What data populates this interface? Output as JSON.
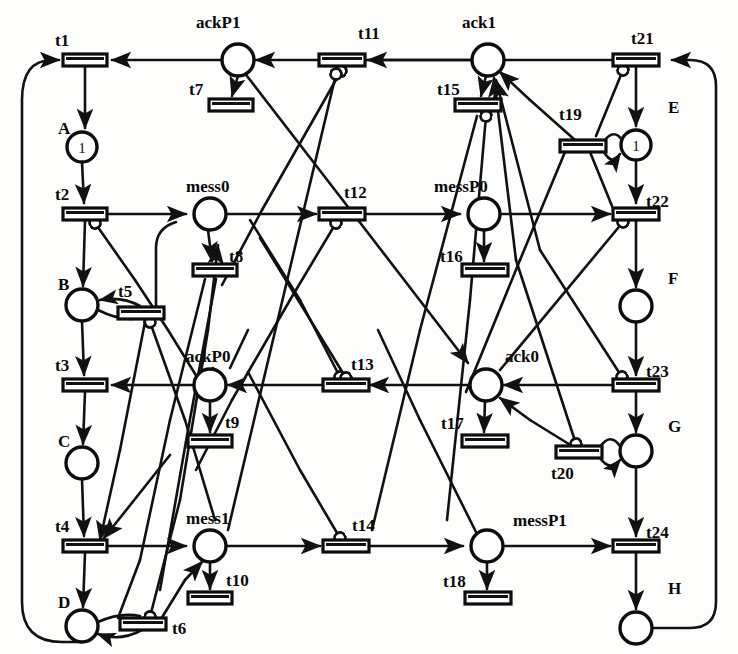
{
  "figure": {
    "kind": "petri-net",
    "title": "",
    "background_color": "#fdfdfb",
    "stroke_color": "#111111"
  },
  "places": [
    {
      "id": "A",
      "label": "A",
      "label_pos": "left",
      "x": 82,
      "y": 147,
      "r": 15,
      "tokens": 1,
      "token_text": "1"
    },
    {
      "id": "B",
      "label": "B",
      "label_pos": "left",
      "x": 82,
      "y": 305,
      "r": 16,
      "tokens": 0,
      "token_text": ""
    },
    {
      "id": "C",
      "label": "C",
      "label_pos": "left",
      "x": 82,
      "y": 463,
      "r": 16,
      "tokens": 0,
      "token_text": ""
    },
    {
      "id": "D",
      "label": "D",
      "label_pos": "left",
      "x": 82,
      "y": 626,
      "r": 16,
      "tokens": 0,
      "token_text": ""
    },
    {
      "id": "E",
      "label": "E",
      "label_pos": "right",
      "x": 636,
      "y": 145,
      "r": 15,
      "tokens": 1,
      "token_text": "1"
    },
    {
      "id": "F",
      "label": "F",
      "label_pos": "right",
      "x": 636,
      "y": 306,
      "r": 16,
      "tokens": 0,
      "token_text": ""
    },
    {
      "id": "G",
      "label": "G",
      "label_pos": "right",
      "x": 636,
      "y": 451,
      "r": 16,
      "tokens": 0,
      "token_text": ""
    },
    {
      "id": "H",
      "label": "H",
      "label_pos": "right",
      "x": 636,
      "y": 628,
      "r": 16,
      "tokens": 0,
      "token_text": ""
    },
    {
      "id": "ackP1",
      "label": "ackP1",
      "label_pos": "above",
      "x": 238,
      "y": 60,
      "r": 16,
      "tokens": 0,
      "token_text": ""
    },
    {
      "id": "mess0",
      "label": "mess0",
      "label_pos": "above",
      "x": 210,
      "y": 214,
      "r": 16,
      "tokens": 0,
      "token_text": ""
    },
    {
      "id": "ackP0",
      "label": "ackP0",
      "label_pos": "above",
      "x": 210,
      "y": 385,
      "r": 16,
      "tokens": 0,
      "token_text": ""
    },
    {
      "id": "mess1",
      "label": "mess1",
      "label_pos": "above",
      "x": 210,
      "y": 546,
      "r": 16,
      "tokens": 0,
      "token_text": ""
    },
    {
      "id": "ack1",
      "label": "ack1",
      "label_pos": "above",
      "x": 488,
      "y": 60,
      "r": 16,
      "tokens": 0,
      "token_text": ""
    },
    {
      "id": "messP0",
      "label": "messP0",
      "label_pos": "above",
      "x": 484,
      "y": 214,
      "r": 16,
      "tokens": 0,
      "token_text": ""
    },
    {
      "id": "ack0",
      "label": "ack0",
      "label_pos": "above",
      "x": 486,
      "y": 385,
      "r": 16,
      "tokens": 0,
      "token_text": ""
    },
    {
      "id": "messP1",
      "label": "messP1",
      "label_pos": "right",
      "x": 487,
      "y": 546,
      "r": 16,
      "tokens": 0,
      "token_text": ""
    }
  ],
  "transitions": [
    {
      "id": "t1",
      "label": "t1",
      "label_pos": "above-left",
      "x": 85,
      "y": 60,
      "w": 44,
      "h": 11,
      "orient": "h"
    },
    {
      "id": "t2",
      "label": "t2",
      "label_pos": "above-left",
      "x": 85,
      "y": 214,
      "w": 44,
      "h": 11,
      "orient": "h"
    },
    {
      "id": "t3",
      "label": "t3",
      "label_pos": "above-left",
      "x": 85,
      "y": 385,
      "w": 44,
      "h": 11,
      "orient": "h"
    },
    {
      "id": "t4",
      "label": "t4",
      "label_pos": "above-left",
      "x": 85,
      "y": 546,
      "w": 44,
      "h": 11,
      "orient": "h"
    },
    {
      "id": "t5",
      "label": "t5",
      "label_pos": "above-left",
      "x": 140,
      "y": 313,
      "w": 44,
      "h": 11,
      "orient": "h"
    },
    {
      "id": "t6",
      "label": "t6",
      "label_pos": "right",
      "x": 142,
      "y": 624,
      "w": 44,
      "h": 11,
      "orient": "h"
    },
    {
      "id": "t7",
      "label": "t7",
      "label_pos": "left",
      "x": 225,
      "y": 105,
      "w": 44,
      "h": 11,
      "orient": "h"
    },
    {
      "id": "t8",
      "label": "t8",
      "label_pos": "right",
      "x": 213,
      "y": 270,
      "w": 44,
      "h": 11,
      "orient": "h"
    },
    {
      "id": "t9",
      "label": "t9",
      "label_pos": "right",
      "x": 210,
      "y": 441,
      "w": 44,
      "h": 11,
      "orient": "h"
    },
    {
      "id": "t10",
      "label": "t10",
      "label_pos": "right",
      "x": 210,
      "y": 598,
      "w": 44,
      "h": 11,
      "orient": "h"
    },
    {
      "id": "t11",
      "label": "t11",
      "label_pos": "above",
      "x": 341,
      "y": 60,
      "w": 44,
      "h": 11,
      "orient": "h"
    },
    {
      "id": "t12",
      "label": "t12",
      "label_pos": "above",
      "x": 341,
      "y": 214,
      "w": 44,
      "h": 11,
      "orient": "h"
    },
    {
      "id": "t13",
      "label": "t13",
      "label_pos": "above",
      "x": 345,
      "y": 385,
      "w": 44,
      "h": 11,
      "orient": "h"
    },
    {
      "id": "t14",
      "label": "t14",
      "label_pos": "above",
      "x": 345,
      "y": 546,
      "w": 44,
      "h": 11,
      "orient": "h"
    },
    {
      "id": "t15",
      "label": "t15",
      "label_pos": "left",
      "x": 477,
      "y": 105,
      "w": 44,
      "h": 11,
      "orient": "h"
    },
    {
      "id": "t16",
      "label": "t16",
      "label_pos": "left",
      "x": 484,
      "y": 270,
      "w": 44,
      "h": 11,
      "orient": "h"
    },
    {
      "id": "t17",
      "label": "t17",
      "label_pos": "left",
      "x": 484,
      "y": 441,
      "w": 44,
      "h": 11,
      "orient": "h"
    },
    {
      "id": "t18",
      "label": "t18",
      "label_pos": "left",
      "x": 487,
      "y": 598,
      "w": 44,
      "h": 11,
      "orient": "h"
    },
    {
      "id": "t19",
      "label": "t19",
      "label_pos": "above",
      "x": 582,
      "y": 146,
      "w": 44,
      "h": 11,
      "orient": "h"
    },
    {
      "id": "t20",
      "label": "t20",
      "label_pos": "below",
      "x": 578,
      "y": 452,
      "w": 44,
      "h": 11,
      "orient": "h"
    },
    {
      "id": "t21",
      "label": "t21",
      "label_pos": "above",
      "x": 636,
      "y": 60,
      "w": 44,
      "h": 11,
      "orient": "h"
    },
    {
      "id": "t22",
      "label": "t22",
      "label_pos": "right",
      "x": 636,
      "y": 214,
      "w": 44,
      "h": 11,
      "orient": "h"
    },
    {
      "id": "t23",
      "label": "t23",
      "label_pos": "right",
      "x": 636,
      "y": 385,
      "w": 44,
      "h": 11,
      "orient": "h"
    },
    {
      "id": "t24",
      "label": "t24",
      "label_pos": "right",
      "x": 636,
      "y": 546,
      "w": 44,
      "h": 11,
      "orient": "h"
    }
  ],
  "arcs": [
    {
      "from": "t1",
      "to": "A",
      "kind": "out"
    },
    {
      "from": "A",
      "to": "t2",
      "kind": "in"
    },
    {
      "from": "t2",
      "to": "B",
      "kind": "out"
    },
    {
      "from": "B",
      "to": "t3",
      "kind": "in"
    },
    {
      "from": "t3",
      "to": "C",
      "kind": "out"
    },
    {
      "from": "C",
      "to": "t4",
      "kind": "in"
    },
    {
      "from": "t4",
      "to": "D",
      "kind": "out"
    },
    {
      "from": "D",
      "to": "t1",
      "kind": "loop-left"
    },
    {
      "from": "t2",
      "to": "mess0",
      "kind": "out"
    },
    {
      "from": "mess0",
      "to": "t12",
      "kind": "in"
    },
    {
      "from": "mess0",
      "to": "t8",
      "kind": "in"
    },
    {
      "from": "t4",
      "to": "mess1",
      "kind": "out"
    },
    {
      "from": "mess1",
      "to": "t14",
      "kind": "in"
    },
    {
      "from": "mess1",
      "to": "t10",
      "kind": "in"
    },
    {
      "from": "ackP1",
      "to": "t1",
      "kind": "in"
    },
    {
      "from": "ackP1",
      "to": "t7",
      "kind": "in"
    },
    {
      "from": "t21",
      "to": "ackP1",
      "kind": "out"
    },
    {
      "from": "ackP0",
      "to": "t3",
      "kind": "in"
    },
    {
      "from": "ackP0",
      "to": "t9",
      "kind": "in"
    },
    {
      "from": "t23",
      "to": "ackP0",
      "kind": "out"
    },
    {
      "from": "t21",
      "to": "E",
      "kind": "out"
    },
    {
      "from": "E",
      "to": "t22",
      "kind": "in"
    },
    {
      "from": "t22",
      "to": "F",
      "kind": "out"
    },
    {
      "from": "F",
      "to": "t23",
      "kind": "in"
    },
    {
      "from": "t23",
      "to": "G",
      "kind": "out"
    },
    {
      "from": "G",
      "to": "t24",
      "kind": "in"
    },
    {
      "from": "t24",
      "to": "H",
      "kind": "out"
    },
    {
      "from": "H",
      "to": "t21",
      "kind": "loop-right"
    },
    {
      "from": "messP0",
      "to": "t22",
      "kind": "in"
    },
    {
      "from": "messP0",
      "to": "t16",
      "kind": "in"
    },
    {
      "from": "t12",
      "to": "messP0",
      "kind": "out"
    },
    {
      "from": "messP1",
      "to": "t24",
      "kind": "in"
    },
    {
      "from": "messP1",
      "to": "t18",
      "kind": "in"
    },
    {
      "from": "t14",
      "to": "messP1",
      "kind": "out"
    },
    {
      "from": "ack1",
      "to": "t11",
      "kind": "in"
    },
    {
      "from": "ack1",
      "to": "t15",
      "kind": "in"
    },
    {
      "from": "ack0",
      "to": "t13",
      "kind": "in"
    },
    {
      "from": "ack0",
      "to": "t17",
      "kind": "in"
    },
    {
      "from": "t19",
      "to": "E",
      "kind": "self-pair"
    },
    {
      "from": "E",
      "to": "t19",
      "kind": "self-pair"
    },
    {
      "from": "t20",
      "to": "G",
      "kind": "self-pair"
    },
    {
      "from": "G",
      "to": "t20",
      "kind": "self-pair"
    },
    {
      "from": "t5",
      "to": "B",
      "kind": "self-pair"
    },
    {
      "from": "B",
      "to": "t5",
      "kind": "self-pair"
    },
    {
      "from": "t6",
      "to": "D",
      "kind": "self-pair"
    },
    {
      "from": "D",
      "to": "t6",
      "kind": "self-pair"
    }
  ],
  "legend": {
    "token_glyph": "1",
    "place_shape": "circle",
    "transition_shape": "bar"
  }
}
